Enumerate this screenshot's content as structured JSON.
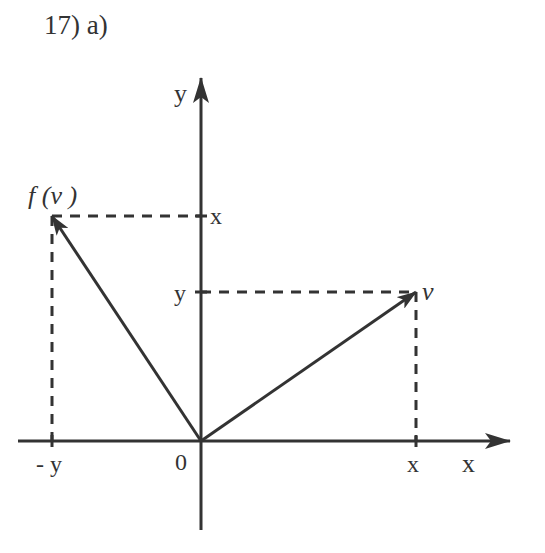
{
  "title": "17)  a)",
  "diagram": {
    "axes": {
      "x_label": "x",
      "y_label": "y",
      "origin_label": "0"
    },
    "points": {
      "v": {
        "label": "v",
        "coords": [
          "x",
          "y"
        ]
      },
      "f_v": {
        "label": "f (v )",
        "coords": [
          "-y",
          "x"
        ]
      }
    },
    "tick_labels": {
      "x_axis_neg": "- y",
      "x_axis_pos": "x",
      "y_axis_upper": "x",
      "y_axis_lower": "y"
    },
    "colors": {
      "ink": "#333333",
      "background": "#ffffff"
    }
  }
}
